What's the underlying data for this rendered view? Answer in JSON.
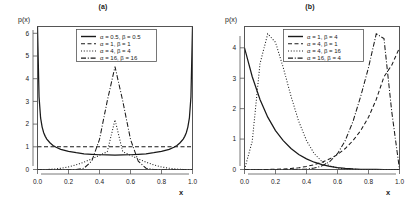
{
  "figure": {
    "background": "#ffffff",
    "line_color": "#1a1a1a",
    "axis_color": "#555555"
  },
  "panels": [
    {
      "id": "a",
      "title": "(a)",
      "xlabel": "x",
      "ylabel": "p(x)",
      "xticks": [
        "0.0",
        "0.2",
        "0.4",
        "0.6",
        "0.8",
        "1.0"
      ],
      "yticks": [
        "0",
        "1",
        "2",
        "3",
        "4",
        "5",
        "6"
      ],
      "legend": [
        {
          "label": "α = 0.5, β = 0.5",
          "style": "solid"
        },
        {
          "label": "α = 1, β = 1",
          "style": "dashed"
        },
        {
          "label": "α = 4, β = 4",
          "style": "dotted"
        },
        {
          "label": "α = 16, β = 16",
          "style": "dashdot"
        }
      ]
    },
    {
      "id": "b",
      "title": "(b)",
      "xlabel": "x",
      "ylabel": "p(x)",
      "xticks": [
        "0.0",
        "0.2",
        "0.4",
        "0.6",
        "0.8",
        "1.0"
      ],
      "yticks": [
        "0",
        "1",
        "2",
        "3",
        "4"
      ],
      "legend": [
        {
          "label": "α = 1, β = 4",
          "style": "solid"
        },
        {
          "label": "α = 4, β = 1",
          "style": "dashed"
        },
        {
          "label": "α = 4, β = 16",
          "style": "dotted"
        },
        {
          "label": "α = 16, β = 4",
          "style": "dashdot"
        }
      ]
    }
  ],
  "chart_data": [
    {
      "type": "line",
      "title": "(a)",
      "xlabel": "x",
      "ylabel": "p(x)",
      "xlim": [
        0,
        1
      ],
      "ylim": [
        0,
        6.3
      ],
      "xticks": [
        0.0,
        0.2,
        0.4,
        0.6,
        0.8,
        1.0
      ],
      "yticks": [
        0,
        1,
        2,
        3,
        4,
        5,
        6
      ],
      "grid": false,
      "legend_position": "top-center",
      "x": [
        0.0,
        0.01,
        0.02,
        0.03,
        0.04,
        0.05,
        0.06,
        0.08,
        0.1,
        0.12,
        0.15,
        0.2,
        0.25,
        0.3,
        0.35,
        0.4,
        0.45,
        0.5,
        0.55,
        0.6,
        0.65,
        0.7,
        0.75,
        0.8,
        0.85,
        0.88,
        0.9,
        0.92,
        0.94,
        0.95,
        0.96,
        0.97,
        0.98,
        0.99,
        1.0
      ],
      "series": [
        {
          "name": "α = 0.5, β = 0.5",
          "style": "solid",
          "values": [
            6.3,
            3.2,
            2.27,
            1.87,
            1.62,
            1.46,
            1.34,
            1.18,
            1.06,
            0.98,
            0.89,
            0.8,
            0.74,
            0.69,
            0.67,
            0.65,
            0.64,
            0.637,
            0.64,
            0.65,
            0.67,
            0.69,
            0.74,
            0.8,
            0.89,
            0.98,
            1.06,
            1.18,
            1.34,
            1.46,
            1.62,
            1.87,
            2.27,
            3.2,
            6.3
          ]
        },
        {
          "name": "α = 1, β = 1",
          "style": "dashed",
          "values": [
            1,
            1,
            1,
            1,
            1,
            1,
            1,
            1,
            1,
            1,
            1,
            1,
            1,
            1,
            1,
            1,
            1,
            1,
            1,
            1,
            1,
            1,
            1,
            1,
            1,
            1,
            1,
            1,
            1,
            1,
            1,
            1,
            1,
            1,
            1
          ]
        },
        {
          "name": "α = 4, β = 4",
          "style": "dotted",
          "values": [
            0.0,
            0.0,
            0.0,
            0.0,
            0.001,
            0.002,
            0.004,
            0.009,
            0.017,
            0.029,
            0.054,
            0.115,
            0.205,
            0.324,
            0.468,
            0.627,
            0.783,
            2.1875,
            0.783,
            0.627,
            0.468,
            0.324,
            0.205,
            0.115,
            0.054,
            0.029,
            0.017,
            0.009,
            0.004,
            0.002,
            0.001,
            0.0,
            0.0,
            0.0,
            0.0
          ]
        },
        {
          "name": "α = 16, β = 16",
          "style": "dashdot",
          "values": [
            0.0,
            0.0,
            0.0,
            0.0,
            0.0,
            0.0,
            0.0,
            0.0,
            0.0,
            0.0,
            0.0,
            0.0,
            0.004,
            0.057,
            0.368,
            1.326,
            3.019,
            4.53,
            3.019,
            1.326,
            0.368,
            0.057,
            0.004,
            0.0,
            0.0,
            0.0,
            0.0,
            0.0,
            0.0,
            0.0,
            0.0,
            0.0,
            0.0,
            0.0,
            0.0
          ]
        }
      ]
    },
    {
      "type": "line",
      "title": "(b)",
      "xlabel": "x",
      "ylabel": "p(x)",
      "xlim": [
        0,
        1
      ],
      "ylim": [
        0,
        4.7
      ],
      "xticks": [
        0.0,
        0.2,
        0.4,
        0.6,
        0.8,
        1.0
      ],
      "yticks": [
        0,
        1,
        2,
        3,
        4
      ],
      "grid": false,
      "legend_position": "top-center",
      "x": [
        0.0,
        0.05,
        0.1,
        0.15,
        0.2,
        0.25,
        0.3,
        0.35,
        0.4,
        0.45,
        0.5,
        0.55,
        0.6,
        0.65,
        0.7,
        0.75,
        0.8,
        0.85,
        0.9,
        0.95,
        1.0
      ],
      "series": [
        {
          "name": "α = 1, β = 4",
          "style": "solid",
          "values": [
            4.0,
            3.05,
            2.3,
            1.72,
            1.28,
            0.95,
            0.69,
            0.49,
            0.35,
            0.24,
            0.16,
            0.1,
            0.06,
            0.035,
            0.018,
            0.008,
            0.003,
            0.001,
            0.0,
            0.0,
            0.0
          ]
        },
        {
          "name": "α = 4, β = 1",
          "style": "dashed",
          "values": [
            0.0,
            0.0,
            0.001,
            0.003,
            0.008,
            0.018,
            0.035,
            0.06,
            0.1,
            0.16,
            0.24,
            0.35,
            0.49,
            0.69,
            0.95,
            1.28,
            1.72,
            2.3,
            3.05,
            3.43,
            4.0
          ]
        },
        {
          "name": "α = 4, β = 16",
          "style": "dotted",
          "values": [
            0.0,
            0.93,
            3.48,
            4.46,
            4.18,
            3.35,
            2.41,
            1.58,
            0.95,
            0.52,
            0.26,
            0.12,
            0.048,
            0.016,
            0.005,
            0.001,
            0.0,
            0.0,
            0.0,
            0.0,
            0.0
          ]
        },
        {
          "name": "α = 16, β = 4",
          "style": "dashdot",
          "values": [
            0.0,
            0.0,
            0.0,
            0.0,
            0.0,
            0.0,
            0.001,
            0.005,
            0.016,
            0.048,
            0.12,
            0.26,
            0.52,
            0.95,
            1.58,
            2.41,
            3.35,
            4.46,
            4.3,
            1.9,
            0.0
          ]
        }
      ]
    }
  ]
}
